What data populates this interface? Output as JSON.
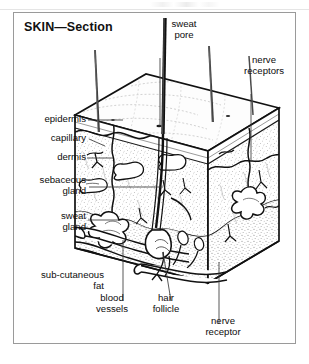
{
  "figure": {
    "title": "SKIN—Section",
    "frame_color": "#9a9a9a",
    "ink_color": "#0d0d0d",
    "background": "#ffffff"
  },
  "labels": {
    "sweat_pore": "sweat\npore",
    "nerve_receptors": "nerve\nreceptors",
    "epidermis": "epidermis",
    "capillary": "capillary",
    "dermis": "dermis",
    "sebaceous_gland": "sebaceous\ngland",
    "sweat_gland": "sweat\ngland",
    "sub_cutaneous_fat": "sub-cutaneous\nfat",
    "blood_vessels": "blood\nvessels",
    "hair_follicle": "hair\nfollicle",
    "nerve_receptor": "nerve\nreceptor"
  }
}
